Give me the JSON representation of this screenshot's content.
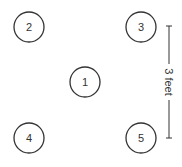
{
  "diagram": {
    "circles": [
      {
        "label": "1",
        "cx": 85,
        "cy": 82
      },
      {
        "label": "2",
        "cx": 29,
        "cy": 27
      },
      {
        "label": "3",
        "cx": 141,
        "cy": 27
      },
      {
        "label": "4",
        "cx": 29,
        "cy": 138
      },
      {
        "label": "5",
        "cx": 141,
        "cy": 138
      }
    ],
    "dimension": {
      "label": "3 feet"
    },
    "colors": {
      "stroke": "#333333",
      "background": "#ffffff"
    }
  }
}
